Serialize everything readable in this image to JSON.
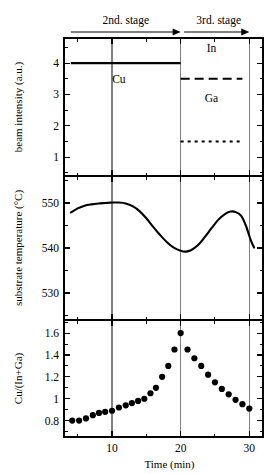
{
  "figure": {
    "background": "#ffffff",
    "foreground": "#000000",
    "gridline_color": "#808080"
  },
  "annotations": {
    "stage2_label": "2nd. stage",
    "stage3_label": "3rd. stage",
    "stage2_arrow_start_min": 4.0,
    "stage2_arrow_end_min": 20.0,
    "stage3_arrow_start_min": 20.5,
    "stage3_arrow_end_min": 30.0
  },
  "panels": {
    "beam_intensity": {
      "ylabel": "beam intensity (a.u.)",
      "yticks": [
        1,
        2,
        3,
        4
      ],
      "ytick_labels": [
        "1",
        "2",
        "3",
        "4"
      ],
      "ylim": [
        0.4,
        4.8
      ],
      "minor_yticks": [
        0.5,
        1.5,
        2.5,
        3.5,
        4.5
      ],
      "series": [
        {
          "name": "Cu",
          "label": "Cu",
          "style": "solid",
          "level": 4.0,
          "x_start": 4.0,
          "x_end": 20.0,
          "label_x": 11.0,
          "label_y": 3.35
        },
        {
          "name": "In",
          "label": "In",
          "style": "dashed",
          "level": 3.5,
          "x_start": 20.0,
          "x_end": 29.0,
          "label_x": 24.5,
          "label_y": 4.35
        },
        {
          "name": "Ga",
          "label": "Ga",
          "style": "dotted",
          "level": 1.5,
          "x_start": 20.0,
          "x_end": 29.0,
          "label_x": 24.5,
          "label_y": 2.75
        }
      ]
    },
    "substrate_temperature": {
      "ylabel": "substrate temperature (°C)",
      "yticks": [
        530,
        540,
        550
      ],
      "ytick_labels": [
        "530",
        "540",
        "550"
      ],
      "ylim": [
        524,
        556
      ],
      "minor_yticks": [
        525,
        535,
        545,
        555
      ],
      "curve": [
        {
          "t": 4.0,
          "T": 547.9
        },
        {
          "t": 5.0,
          "T": 548.8
        },
        {
          "t": 6.0,
          "T": 549.4
        },
        {
          "t": 7.0,
          "T": 549.7
        },
        {
          "t": 8.0,
          "T": 549.9
        },
        {
          "t": 9.0,
          "T": 550.0
        },
        {
          "t": 10.0,
          "T": 550.1
        },
        {
          "t": 11.0,
          "T": 550.1
        },
        {
          "t": 12.0,
          "T": 549.9
        },
        {
          "t": 13.0,
          "T": 549.3
        },
        {
          "t": 14.0,
          "T": 548.2
        },
        {
          "t": 15.0,
          "T": 546.6
        },
        {
          "t": 16.0,
          "T": 544.7
        },
        {
          "t": 17.0,
          "T": 542.9
        },
        {
          "t": 18.0,
          "T": 541.3
        },
        {
          "t": 19.0,
          "T": 540.1
        },
        {
          "t": 20.0,
          "T": 539.4
        },
        {
          "t": 20.8,
          "T": 539.2
        },
        {
          "t": 21.5,
          "T": 539.5
        },
        {
          "t": 22.5,
          "T": 540.6
        },
        {
          "t": 23.5,
          "T": 542.4
        },
        {
          "t": 24.5,
          "T": 544.4
        },
        {
          "t": 25.5,
          "T": 546.3
        },
        {
          "t": 26.5,
          "T": 547.6
        },
        {
          "t": 27.3,
          "T": 548.1
        },
        {
          "t": 28.0,
          "T": 548.0
        },
        {
          "t": 28.8,
          "T": 547.2
        },
        {
          "t": 29.5,
          "T": 545.0
        },
        {
          "t": 30.2,
          "T": 541.8
        },
        {
          "t": 30.7,
          "T": 540.1
        }
      ]
    },
    "cu_ratio": {
      "ylabel": "Cu/(In+Ga)",
      "yticks": [
        0.8,
        1.0,
        1.2,
        1.4,
        1.6
      ],
      "ytick_labels": [
        "0.8",
        "1",
        "1.2",
        "1.4",
        "1.6"
      ],
      "ylim": [
        0.65,
        1.72
      ],
      "minor_yticks": [
        0.7,
        0.9,
        1.1,
        1.3,
        1.5,
        1.7
      ],
      "marker": "filled-circle",
      "points": [
        {
          "t": 4.2,
          "v": 0.8
        },
        {
          "t": 5.2,
          "v": 0.8
        },
        {
          "t": 6.2,
          "v": 0.82
        },
        {
          "t": 7.2,
          "v": 0.85
        },
        {
          "t": 8.1,
          "v": 0.87
        },
        {
          "t": 9.0,
          "v": 0.88
        },
        {
          "t": 10.0,
          "v": 0.89
        },
        {
          "t": 11.0,
          "v": 0.92
        },
        {
          "t": 12.0,
          "v": 0.94
        },
        {
          "t": 12.9,
          "v": 0.96
        },
        {
          "t": 13.8,
          "v": 0.98
        },
        {
          "t": 14.7,
          "v": 1.0
        },
        {
          "t": 15.6,
          "v": 1.05
        },
        {
          "t": 16.4,
          "v": 1.1
        },
        {
          "t": 17.3,
          "v": 1.2
        },
        {
          "t": 18.2,
          "v": 1.3
        },
        {
          "t": 19.1,
          "v": 1.45
        },
        {
          "t": 20.0,
          "v": 1.6
        },
        {
          "t": 21.0,
          "v": 1.45
        },
        {
          "t": 22.0,
          "v": 1.37
        },
        {
          "t": 23.0,
          "v": 1.3
        },
        {
          "t": 24.0,
          "v": 1.22
        },
        {
          "t": 25.0,
          "v": 1.15
        },
        {
          "t": 26.0,
          "v": 1.09
        },
        {
          "t": 27.0,
          "v": 1.04
        },
        {
          "t": 28.0,
          "v": 0.99
        },
        {
          "t": 29.0,
          "v": 0.95
        },
        {
          "t": 30.0,
          "v": 0.91
        }
      ]
    }
  },
  "xaxis": {
    "label": "Time (min)",
    "ticks": [
      10,
      20,
      30
    ],
    "tick_labels": [
      "10",
      "20",
      "30"
    ],
    "minor_ticks": [
      5,
      15,
      25
    ],
    "xlim": [
      3.0,
      32.0
    ],
    "gridlines": [
      10,
      20,
      30
    ]
  },
  "chart_data": {
    "type": "line",
    "title": "",
    "xlabel": "Time (min)",
    "panels": [
      {
        "id": "beam-intensity",
        "type": "line",
        "ylabel": "beam intensity (a.u.)",
        "ylim": [
          0.4,
          4.8
        ],
        "xlim": [
          3.0,
          32.0
        ],
        "grid": true,
        "series": [
          {
            "name": "Cu",
            "style": "solid",
            "x": [
              4.0,
              20.0
            ],
            "values": [
              4.0,
              4.0
            ]
          },
          {
            "name": "In",
            "style": "dashed",
            "x": [
              20.0,
              29.0
            ],
            "values": [
              3.5,
              3.5
            ]
          },
          {
            "name": "Ga",
            "style": "dotted",
            "x": [
              20.0,
              29.0
            ],
            "values": [
              1.5,
              1.5
            ]
          }
        ]
      },
      {
        "id": "substrate-temperature",
        "type": "line",
        "ylabel": "substrate temperature (°C)",
        "ylim": [
          524,
          556
        ],
        "xlim": [
          3.0,
          32.0
        ],
        "grid": true,
        "series": [
          {
            "name": "substrate temperature",
            "style": "solid",
            "x": [
              4.0,
              5.0,
              6.0,
              7.0,
              8.0,
              9.0,
              10.0,
              11.0,
              12.0,
              13.0,
              14.0,
              15.0,
              16.0,
              17.0,
              18.0,
              19.0,
              20.0,
              20.8,
              21.5,
              22.5,
              23.5,
              24.5,
              25.5,
              26.5,
              27.3,
              28.0,
              28.8,
              29.5,
              30.2,
              30.7
            ],
            "values": [
              547.9,
              548.8,
              549.4,
              549.7,
              549.9,
              550.0,
              550.1,
              550.1,
              549.9,
              549.3,
              548.2,
              546.6,
              544.7,
              542.9,
              541.3,
              540.1,
              539.4,
              539.2,
              539.5,
              540.6,
              542.4,
              544.4,
              546.3,
              547.6,
              548.1,
              548.0,
              547.2,
              545.0,
              541.8,
              540.1
            ]
          }
        ]
      },
      {
        "id": "cu-ratio",
        "type": "scatter",
        "ylabel": "Cu/(In+Ga)",
        "ylim": [
          0.65,
          1.72
        ],
        "xlim": [
          3.0,
          32.0
        ],
        "grid": true,
        "series": [
          {
            "name": "Cu/(In+Ga)",
            "style": "markers",
            "x": [
              4.2,
              5.2,
              6.2,
              7.2,
              8.1,
              9.0,
              10.0,
              11.0,
              12.0,
              12.9,
              13.8,
              14.7,
              15.6,
              16.4,
              17.3,
              18.2,
              19.1,
              20.0,
              21.0,
              22.0,
              23.0,
              24.0,
              25.0,
              26.0,
              27.0,
              28.0,
              29.0,
              30.0
            ],
            "values": [
              0.8,
              0.8,
              0.82,
              0.85,
              0.87,
              0.88,
              0.89,
              0.92,
              0.94,
              0.96,
              0.98,
              1.0,
              1.05,
              1.1,
              1.2,
              1.3,
              1.45,
              1.6,
              1.45,
              1.37,
              1.3,
              1.22,
              1.15,
              1.09,
              1.04,
              0.99,
              0.95,
              0.91
            ]
          }
        ]
      }
    ],
    "annotations": [
      {
        "text": "2nd. stage",
        "x_start": 4.0,
        "x_end": 20.0
      },
      {
        "text": "3rd. stage",
        "x_start": 20.5,
        "x_end": 30.0
      }
    ]
  }
}
